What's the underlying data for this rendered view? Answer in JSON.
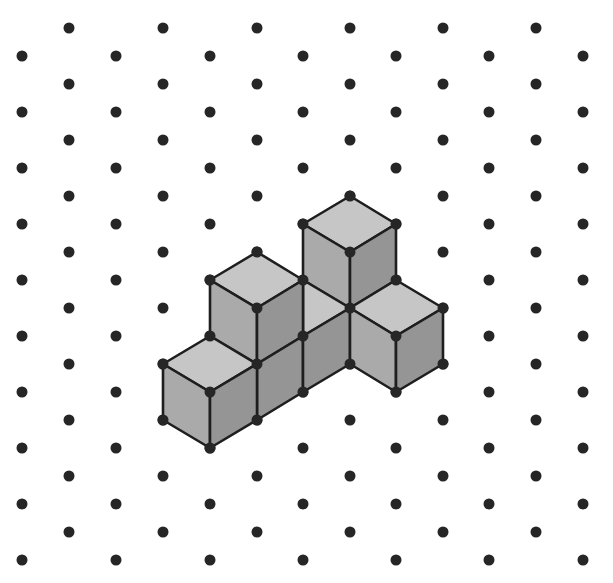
{
  "diagram": {
    "type": "isometric-dot-grid-with-cubes",
    "width": 613,
    "height": 583,
    "colors": {
      "background": "#ffffff",
      "dot": "#262626",
      "outline": "#1e1e1e",
      "top_face": "#c6c6c6",
      "left_face": "#aaaaaa",
      "right_face": "#959595"
    },
    "grid": {
      "dot_radius": 5.5,
      "odd_columns_x": [
        69,
        163,
        257,
        350,
        443,
        536
      ],
      "odd_columns_y_start": 28,
      "even_columns_x": [
        22,
        116,
        210,
        303,
        396,
        489,
        583
      ],
      "even_columns_y_start": 56,
      "row_step": 56,
      "rows_per_column": 10
    },
    "cube_count": 5,
    "faces": [
      {
        "name": "cube-c-top",
        "shade": "top",
        "points": [
          [
            350,
            196
          ],
          [
            396,
            224
          ],
          [
            350,
            252
          ],
          [
            303,
            224
          ]
        ]
      },
      {
        "name": "cube-c-left",
        "shade": "left",
        "points": [
          [
            303,
            224
          ],
          [
            350,
            252
          ],
          [
            350,
            308
          ],
          [
            303,
            280
          ]
        ]
      },
      {
        "name": "cube-c-right",
        "shade": "right",
        "points": [
          [
            350,
            252
          ],
          [
            396,
            224
          ],
          [
            396,
            280
          ],
          [
            350,
            308
          ]
        ]
      },
      {
        "name": "middle-cube-top-partial",
        "shade": "top",
        "points": [
          [
            303,
            280
          ],
          [
            350,
            308
          ],
          [
            303,
            336
          ]
        ]
      },
      {
        "name": "cube-b-top",
        "shade": "top",
        "points": [
          [
            257,
            252
          ],
          [
            303,
            280
          ],
          [
            257,
            308
          ],
          [
            210,
            280
          ]
        ]
      },
      {
        "name": "cube-b-left",
        "shade": "left",
        "points": [
          [
            210,
            280
          ],
          [
            257,
            308
          ],
          [
            257,
            364
          ],
          [
            210,
            336
          ]
        ]
      },
      {
        "name": "cube-b-right",
        "shade": "right",
        "points": [
          [
            257,
            308
          ],
          [
            303,
            280
          ],
          [
            303,
            336
          ],
          [
            257,
            364
          ]
        ]
      },
      {
        "name": "middle-row-right-face-1",
        "shade": "right",
        "points": [
          [
            257,
            364
          ],
          [
            303,
            336
          ],
          [
            303,
            392
          ],
          [
            257,
            420
          ]
        ]
      },
      {
        "name": "middle-row-right-face-2",
        "shade": "right",
        "points": [
          [
            303,
            336
          ],
          [
            350,
            308
          ],
          [
            350,
            364
          ],
          [
            303,
            392
          ]
        ]
      },
      {
        "name": "cube-d-top",
        "shade": "top",
        "points": [
          [
            396,
            280
          ],
          [
            443,
            308
          ],
          [
            396,
            336
          ],
          [
            350,
            308
          ]
        ]
      },
      {
        "name": "cube-d-left",
        "shade": "left",
        "points": [
          [
            350,
            308
          ],
          [
            396,
            336
          ],
          [
            396,
            392
          ],
          [
            350,
            364
          ]
        ]
      },
      {
        "name": "cube-d-right",
        "shade": "right",
        "points": [
          [
            396,
            336
          ],
          [
            443,
            308
          ],
          [
            443,
            364
          ],
          [
            396,
            392
          ]
        ]
      },
      {
        "name": "cube-a-top",
        "shade": "top",
        "points": [
          [
            210,
            336
          ],
          [
            257,
            364
          ],
          [
            210,
            392
          ],
          [
            163,
            364
          ]
        ]
      },
      {
        "name": "cube-a-left",
        "shade": "left",
        "points": [
          [
            163,
            364
          ],
          [
            210,
            392
          ],
          [
            210,
            448
          ],
          [
            163,
            420
          ]
        ]
      },
      {
        "name": "cube-a-right",
        "shade": "right",
        "points": [
          [
            210,
            392
          ],
          [
            257,
            364
          ],
          [
            257,
            420
          ],
          [
            210,
            448
          ]
        ]
      }
    ],
    "vertex_dots": [
      [
        350,
        196
      ],
      [
        303,
        224
      ],
      [
        396,
        224
      ],
      [
        350,
        252
      ],
      [
        303,
        280
      ],
      [
        396,
        280
      ],
      [
        350,
        308
      ],
      [
        257,
        252
      ],
      [
        210,
        280
      ],
      [
        257,
        308
      ],
      [
        257,
        364
      ],
      [
        210,
        336
      ],
      [
        303,
        336
      ],
      [
        443,
        308
      ],
      [
        396,
        336
      ],
      [
        396,
        392
      ],
      [
        350,
        364
      ],
      [
        443,
        364
      ],
      [
        163,
        364
      ],
      [
        210,
        392
      ],
      [
        210,
        448
      ],
      [
        163,
        420
      ],
      [
        257,
        420
      ],
      [
        303,
        392
      ]
    ]
  }
}
